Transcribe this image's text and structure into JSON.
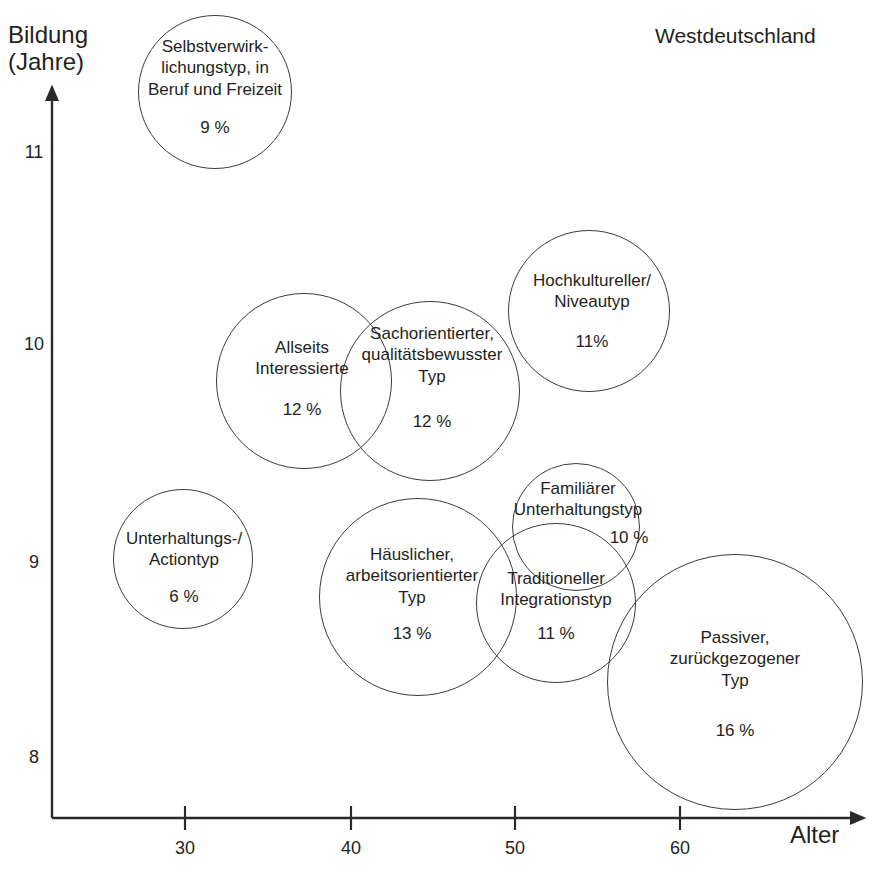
{
  "region_label": "Westdeutschland",
  "axes": {
    "y_title": "Bildung\n(Jahre)",
    "x_title": "Alter",
    "y_ticks": [
      "11",
      "10",
      "9",
      "8"
    ],
    "x_ticks": [
      "30",
      "40",
      "50",
      "60"
    ]
  },
  "chart_data": {
    "type": "scatter",
    "title": "Westdeutschland",
    "xlabel": "Alter",
    "ylabel": "Bildung (Jahre)",
    "xlim": [
      24,
      66
    ],
    "ylim": [
      7.6,
      11.6
    ],
    "xticks": [
      30,
      40,
      50,
      60
    ],
    "yticks": [
      8,
      9,
      10,
      11
    ],
    "grid": false,
    "legend": "none",
    "size_encoding": "percent share of population (bubble area)",
    "points": [
      {
        "label": "Selbstverwirk-\nlichungstyp, in\nBeruf und Freizeit",
        "label_plain": "Selbstverwirklichungstyp, in Beruf und Freizeit",
        "value": "9 %",
        "percent": 9,
        "x": 36,
        "y": 11.55,
        "px": 215,
        "py": 92,
        "r": 77
      },
      {
        "label": "Hochkultureller/\nNiveautyp",
        "label_plain": "Hochkultureller/ Niveautyp",
        "value": "11%",
        "percent": 11,
        "x": 55,
        "y": 10.25,
        "px": 589,
        "py": 311,
        "r": 81
      },
      {
        "label": "Allseits\nInteressierte",
        "label_plain": "Allseits Interessierte",
        "value": "12 %",
        "percent": 12,
        "x": 40,
        "y": 10.0,
        "px": 304,
        "py": 381,
        "r": 88
      },
      {
        "label": "Sachorientierter,\nqualitätsbewusster\nTyp",
        "label_plain": "Sachorientierter, qualitätsbewusster Typ",
        "value": "12 %",
        "percent": 12,
        "x": 45,
        "y": 10.0,
        "px": 430,
        "py": 391,
        "r": 90
      },
      {
        "label": "Familiärer\nUnterhaltungstyp",
        "label_plain": "Familiärer Unterhaltungstyp",
        "value": "10 %",
        "percent": 10,
        "x": 54,
        "y": 9.3,
        "px": 576,
        "py": 527,
        "r": 64
      },
      {
        "label": "Unterhaltungs-/\nActiontyp",
        "label_plain": "Unterhaltungs-/ Actiontyp",
        "value": "6 %",
        "percent": 6,
        "x": 30,
        "y": 8.95,
        "px": 183,
        "py": 559,
        "r": 70
      },
      {
        "label": "Häuslicher,\narbeitsorientierter\nTyp",
        "label_plain": "Häuslicher, arbeitsorientierter Typ",
        "value": "13 %",
        "percent": 13,
        "x": 45,
        "y": 8.7,
        "px": 418,
        "py": 597,
        "r": 99
      },
      {
        "label": "Traditioneller\nIntegrationstyp",
        "label_plain": "Traditioneller Integrationstyp",
        "value": "11 %",
        "percent": 11,
        "x": 52,
        "y": 8.75,
        "px": 556,
        "py": 603,
        "r": 80
      },
      {
        "label": "Passiver,\nzurückgezogener\nTyp",
        "label_plain": "Passiver, zurückgezogener Typ",
        "value": "16 %",
        "percent": 16,
        "x": 63,
        "y": 8.4,
        "px": 735,
        "py": 682,
        "r": 128
      }
    ]
  },
  "colors": {
    "stroke": "#3c3c3c",
    "axis": "#2a2a2a",
    "text": "#231f20",
    "background": "#ffffff"
  }
}
